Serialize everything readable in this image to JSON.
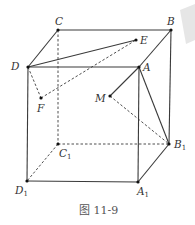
{
  "figure": {
    "caption": "图 11-9",
    "type": "cube-with-points",
    "labels": {
      "A": "A",
      "B": "B",
      "C": "C",
      "D": "D",
      "A1": "A",
      "B1": "B",
      "C1": "C",
      "D1": "D",
      "sub1": "1",
      "E": "E",
      "F": "F",
      "M": "M"
    },
    "points": {
      "A": [
        139,
        67
      ],
      "B": [
        171,
        30
      ],
      "C": [
        58,
        30
      ],
      "D": [
        28,
        67
      ],
      "A1": [
        138,
        182
      ],
      "B1": [
        169,
        144
      ],
      "C1": [
        58,
        144
      ],
      "D1": [
        27,
        181
      ],
      "E": [
        136,
        40
      ],
      "F": [
        41,
        98
      ],
      "M": [
        110,
        96
      ]
    },
    "solid_edges": [
      [
        "D",
        "C"
      ],
      [
        "C",
        "B"
      ],
      [
        "D",
        "A"
      ],
      [
        "A",
        "B"
      ],
      [
        "D",
        "D1"
      ],
      [
        "A",
        "A1"
      ],
      [
        "B",
        "B1"
      ],
      [
        "D1",
        "A1"
      ],
      [
        "A1",
        "B1"
      ],
      [
        "D",
        "E"
      ],
      [
        "A",
        "M"
      ],
      [
        "A",
        "B1"
      ]
    ],
    "dashed_edges": [
      [
        "C",
        "C1"
      ],
      [
        "C1",
        "B1"
      ],
      [
        "C1",
        "D1"
      ],
      [
        "D",
        "F"
      ],
      [
        "F",
        "E"
      ],
      [
        "M",
        "B1"
      ]
    ]
  }
}
